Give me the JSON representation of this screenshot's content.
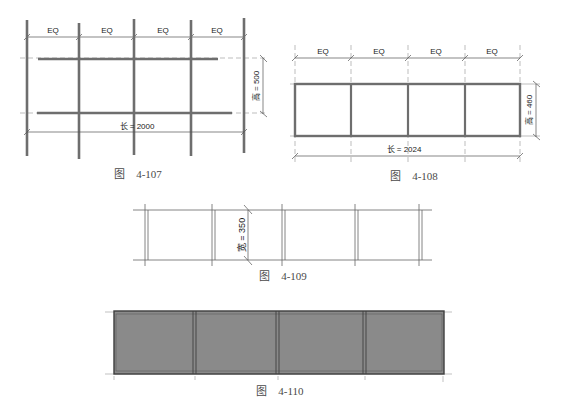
{
  "figures": {
    "fig107": {
      "caption": "图　4-107",
      "eq_labels": [
        "EQ",
        "EQ",
        "EQ",
        "EQ"
      ],
      "length_label": "长 = 2000",
      "height_label": "高 = 500",
      "grid_x": [
        27,
        79,
        134,
        191,
        244
      ],
      "rails_y": [
        58,
        112
      ]
    },
    "fig108": {
      "caption": "图　4-108",
      "eq_labels": [
        "EQ",
        "EQ",
        "EQ",
        "EQ"
      ],
      "length_label": "长 = 2024",
      "height_label": "高 = 460",
      "grid_x": [
        295,
        351,
        408,
        465,
        520
      ]
    },
    "fig109": {
      "caption": "图　4-109",
      "width_label": "宽 = 350",
      "grid_x": [
        147,
        213,
        283,
        357,
        421
      ]
    },
    "fig110": {
      "caption": "图　4-110",
      "panel_fill": "#8a8a8a",
      "grid_x": [
        114,
        194,
        277,
        364,
        443
      ]
    }
  },
  "colors": {
    "mullion": "#6e6e6e",
    "line": "#555555",
    "dashed": "#9a9a9a",
    "frame": "#4a4a4a"
  }
}
